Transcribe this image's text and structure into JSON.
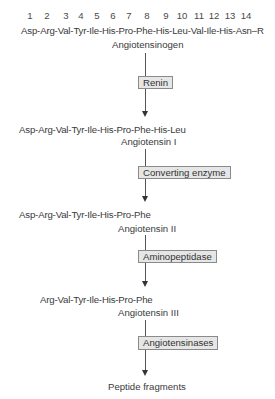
{
  "diagram": {
    "residue_numbers": [
      "1",
      "2",
      "3",
      "4",
      "5",
      "6",
      "7",
      "8",
      "9",
      "10",
      "11",
      "12",
      "13",
      "14"
    ],
    "nodes": [
      {
        "id": "angiotensinogen",
        "sequence": "Asp-Arg-Val-Tyr-Ile-His-Pro-Phe-His-Leu-Val-Ile-His-Asn–R",
        "label": "Angiotensinogen"
      },
      {
        "id": "angiotensin_1",
        "sequence": "Asp-Arg-Val-Tyr-Ile-His-Pro-Phe-His-Leu",
        "label": "Angiotensin I"
      },
      {
        "id": "angiotensin_2",
        "sequence": "Asp-Arg-Val-Tyr-Ile-His-Pro-Phe",
        "label": "Angiotensin II"
      },
      {
        "id": "angiotensin_3",
        "sequence": "Arg-Val-Tyr-Ile-His-Pro-Phe",
        "label": "Angiotensin III"
      },
      {
        "id": "fragments",
        "sequence": "",
        "label": "Peptide fragments"
      }
    ],
    "enzymes": [
      {
        "from": "angiotensinogen",
        "to": "angiotensin_1",
        "label": "Renin"
      },
      {
        "from": "angiotensin_1",
        "to": "angiotensin_2",
        "label": "Converting enzyme"
      },
      {
        "from": "angiotensin_2",
        "to": "angiotensin_3",
        "label": "Aminopeptidase"
      },
      {
        "from": "angiotensin_3",
        "to": "fragments",
        "label": "Angiotensinases"
      }
    ],
    "colors": {
      "line": "#555555",
      "box_fill": "#e6e6e6",
      "box_border": "#8a8a8a",
      "text": "#3a3a3a"
    }
  }
}
